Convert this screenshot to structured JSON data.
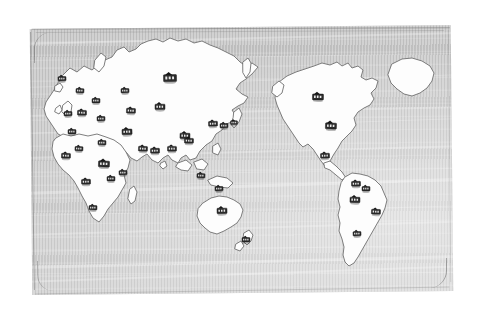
{
  "map": {
    "title": "World Map",
    "style": "hand-drawn pencil sketch",
    "ocean_color": "#b9b9b9",
    "land_color": "#fdfdfd",
    "outline_color": "#6f6f6f",
    "marker_color": "#2b2b2b",
    "page_background": "#ffffff",
    "marker_icon": "building-marker-icon",
    "marker_count": 36,
    "frame": {
      "x": 31,
      "y": 27,
      "width": 421,
      "height": 266,
      "rotation_deg": -0.55
    }
  },
  "continents": [
    {
      "name": "eurasia",
      "label": "Eurasia"
    },
    {
      "name": "africa",
      "label": "Africa"
    },
    {
      "name": "north-america",
      "label": "North America"
    },
    {
      "name": "south-america",
      "label": "South America"
    },
    {
      "name": "greenland",
      "label": "Greenland"
    },
    {
      "name": "australia",
      "label": "Australia"
    },
    {
      "name": "new-zealand",
      "label": "New Zealand"
    },
    {
      "name": "japan",
      "label": "Japan"
    },
    {
      "name": "indonesia",
      "label": "Indonesia"
    },
    {
      "name": "british-isles",
      "label": "British Isles"
    },
    {
      "name": "madagascar",
      "label": "Madagascar"
    }
  ],
  "markers": [
    {
      "id": 1,
      "region": "eurasia",
      "x": 170,
      "y": 77,
      "size": 13
    },
    {
      "id": 2,
      "region": "eurasia",
      "x": 160,
      "y": 106,
      "size": 10
    },
    {
      "id": 3,
      "region": "eurasia",
      "x": 185,
      "y": 135,
      "size": 10
    },
    {
      "id": 4,
      "region": "eurasia",
      "x": 131,
      "y": 110,
      "size": 9
    },
    {
      "id": 5,
      "region": "eurasia",
      "x": 127,
      "y": 131,
      "size": 10
    },
    {
      "id": 6,
      "region": "eurasia",
      "x": 125,
      "y": 90,
      "size": 8
    },
    {
      "id": 7,
      "region": "eurasia",
      "x": 96,
      "y": 100,
      "size": 8
    },
    {
      "id": 8,
      "region": "eurasia",
      "x": 82,
      "y": 112,
      "size": 9
    },
    {
      "id": 9,
      "region": "eurasia",
      "x": 80,
      "y": 90,
      "size": 8
    },
    {
      "id": 10,
      "region": "british-isles",
      "x": 68,
      "y": 113,
      "size": 8
    },
    {
      "id": 11,
      "region": "eurasia",
      "x": 101,
      "y": 118,
      "size": 8
    },
    {
      "id": 12,
      "region": "eurasia",
      "x": 72,
      "y": 131,
      "size": 8
    },
    {
      "id": 13,
      "region": "eurasia",
      "x": 102,
      "y": 142,
      "size": 8
    },
    {
      "id": 14,
      "region": "eurasia",
      "x": 79,
      "y": 148,
      "size": 8
    },
    {
      "id": 15,
      "region": "eurasia",
      "x": 62,
      "y": 78,
      "size": 8
    },
    {
      "id": 16,
      "region": "eurasia",
      "x": 155,
      "y": 150,
      "size": 9
    },
    {
      "id": 17,
      "region": "eurasia",
      "x": 172,
      "y": 148,
      "size": 9
    },
    {
      "id": 18,
      "region": "eurasia",
      "x": 189,
      "y": 140,
      "size": 9
    },
    {
      "id": 19,
      "region": "eurasia",
      "x": 143,
      "y": 148,
      "size": 9
    },
    {
      "id": 20,
      "region": "eurasia",
      "x": 213,
      "y": 123,
      "size": 9
    },
    {
      "id": 21,
      "region": "eurasia",
      "x": 224,
      "y": 125,
      "size": 8
    },
    {
      "id": 22,
      "region": "japan",
      "x": 234,
      "y": 122,
      "size": 7
    },
    {
      "id": 23,
      "region": "africa",
      "x": 66,
      "y": 155,
      "size": 9
    },
    {
      "id": 24,
      "region": "africa",
      "x": 104,
      "y": 163,
      "size": 11
    },
    {
      "id": 25,
      "region": "africa",
      "x": 123,
      "y": 172,
      "size": 8
    },
    {
      "id": 26,
      "region": "africa",
      "x": 86,
      "y": 181,
      "size": 9
    },
    {
      "id": 27,
      "region": "africa",
      "x": 111,
      "y": 178,
      "size": 8
    },
    {
      "id": 28,
      "region": "africa",
      "x": 93,
      "y": 207,
      "size": 8
    },
    {
      "id": 29,
      "region": "indonesia",
      "x": 201,
      "y": 175,
      "size": 8
    },
    {
      "id": 30,
      "region": "indonesia",
      "x": 219,
      "y": 188,
      "size": 8
    },
    {
      "id": 31,
      "region": "australia",
      "x": 222,
      "y": 210,
      "size": 10
    },
    {
      "id": 32,
      "region": "new-zealand",
      "x": 246,
      "y": 239,
      "size": 8
    },
    {
      "id": 33,
      "region": "north-america",
      "x": 318,
      "y": 96,
      "size": 11
    },
    {
      "id": 34,
      "region": "north-america",
      "x": 331,
      "y": 125,
      "size": 11
    },
    {
      "id": 35,
      "region": "north-america",
      "x": 325,
      "y": 155,
      "size": 9
    },
    {
      "id": 36,
      "region": "south-america",
      "x": 356,
      "y": 183,
      "size": 9
    },
    {
      "id": 37,
      "region": "south-america",
      "x": 366,
      "y": 188,
      "size": 8
    },
    {
      "id": 38,
      "region": "south-america",
      "x": 355,
      "y": 199,
      "size": 10
    },
    {
      "id": 39,
      "region": "south-america",
      "x": 376,
      "y": 211,
      "size": 9
    },
    {
      "id": 40,
      "region": "south-america",
      "x": 357,
      "y": 233,
      "size": 8
    }
  ],
  "streaks": [
    {
      "top": 14,
      "height": 2,
      "rot": -0.9,
      "opacity": 0.5
    },
    {
      "top": 31,
      "height": 1,
      "rot": -0.4,
      "opacity": 0.35
    },
    {
      "top": 58,
      "height": 1,
      "rot": -1.1,
      "opacity": 0.4
    },
    {
      "top": 86,
      "height": 2,
      "rot": -0.6,
      "opacity": 0.45
    },
    {
      "top": 104,
      "height": 1,
      "rot": -1.4,
      "opacity": 0.38
    },
    {
      "top": 128,
      "height": 2,
      "rot": -1.0,
      "opacity": 0.48
    },
    {
      "top": 147,
      "height": 1,
      "rot": -0.5,
      "opacity": 0.33
    },
    {
      "top": 163,
      "height": 3,
      "rot": -1.3,
      "opacity": 0.52
    },
    {
      "top": 186,
      "height": 1,
      "rot": -0.7,
      "opacity": 0.34
    },
    {
      "top": 205,
      "height": 2,
      "rot": -1.2,
      "opacity": 0.45
    },
    {
      "top": 222,
      "height": 1,
      "rot": -0.3,
      "opacity": 0.3
    },
    {
      "top": 237,
      "height": 3,
      "rot": -0.9,
      "opacity": 0.55
    },
    {
      "top": 252,
      "height": 2,
      "rot": -1.5,
      "opacity": 0.5
    },
    {
      "top": 244,
      "height": 1,
      "rot": 0.4,
      "opacity": 0.3
    },
    {
      "top": 70,
      "height": 1,
      "rot": 0.6,
      "opacity": 0.28
    }
  ]
}
